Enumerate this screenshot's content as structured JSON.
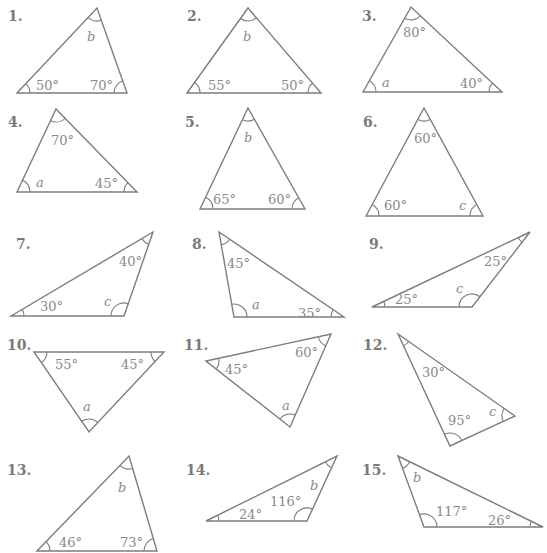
{
  "worksheet": {
    "topic": "Find the missing angle in each triangle",
    "line_color": "#7d7d7d",
    "text_color": "#8a8a8a",
    "problems": [
      {
        "number": "1.",
        "num_pos": [
          8,
          8
        ],
        "vertices": [
          [
            17,
            93
          ],
          [
            97,
            8
          ],
          [
            127,
            93
          ]
        ],
        "angles": [
          {
            "label": "50°",
            "var": false,
            "at": [
              36,
              79
            ]
          },
          {
            "label": "b",
            "var": true,
            "at": [
              87,
              30
            ]
          },
          {
            "label": "70°",
            "var": false,
            "at": [
              90,
              79
            ]
          }
        ]
      },
      {
        "number": "2.",
        "num_pos": [
          187,
          8
        ],
        "vertices": [
          [
            187,
            93
          ],
          [
            248,
            8
          ],
          [
            321,
            93
          ]
        ],
        "angles": [
          {
            "label": "55°",
            "var": false,
            "at": [
              208,
              79
            ]
          },
          {
            "label": "b",
            "var": true,
            "at": [
              243,
              30
            ]
          },
          {
            "label": "50°",
            "var": false,
            "at": [
              281,
              79
            ]
          }
        ]
      },
      {
        "number": "3.",
        "num_pos": [
          362,
          8
        ],
        "vertices": [
          [
            363,
            92
          ],
          [
            411,
            7
          ],
          [
            502,
            92
          ]
        ],
        "angles": [
          {
            "label": "a",
            "var": true,
            "at": [
              382,
              76
            ]
          },
          {
            "label": "80°",
            "var": false,
            "at": [
              403,
              26
            ]
          },
          {
            "label": "40°",
            "var": false,
            "at": [
              460,
              77
            ]
          }
        ]
      },
      {
        "number": "4.",
        "num_pos": [
          8,
          114
        ],
        "vertices": [
          [
            17,
            192
          ],
          [
            56,
            109
          ],
          [
            137,
            192
          ]
        ],
        "angles": [
          {
            "label": "a",
            "var": true,
            "at": [
              36,
              176
            ]
          },
          {
            "label": "70°",
            "var": false,
            "at": [
              51,
              134
            ]
          },
          {
            "label": "45°",
            "var": false,
            "at": [
              95,
              177
            ]
          }
        ]
      },
      {
        "number": "5.",
        "num_pos": [
          185,
          114
        ],
        "vertices": [
          [
            200,
            209
          ],
          [
            248,
            108
          ],
          [
            305,
            209
          ]
        ],
        "angles": [
          {
            "label": "65°",
            "var": false,
            "at": [
              213,
              193
            ]
          },
          {
            "label": "b",
            "var": true,
            "at": [
              244,
              131
            ]
          },
          {
            "label": "60°",
            "var": false,
            "at": [
              268,
              193
            ]
          }
        ]
      },
      {
        "number": "6.",
        "num_pos": [
          363,
          114
        ],
        "vertices": [
          [
            366,
            216
          ],
          [
            424,
            108
          ],
          [
            483,
            216
          ]
        ],
        "angles": [
          {
            "label": "60°",
            "var": false,
            "at": [
              384,
              199
            ]
          },
          {
            "label": "60°",
            "var": false,
            "at": [
              414,
              132
            ]
          },
          {
            "label": "c",
            "var": true,
            "at": [
              459,
              199
            ]
          }
        ]
      },
      {
        "number": "7.",
        "num_pos": [
          16,
          236
        ],
        "vertices": [
          [
            11,
            316
          ],
          [
            153,
            232
          ],
          [
            124,
            316
          ]
        ],
        "angles": [
          {
            "label": "30°",
            "var": false,
            "at": [
              40,
              300
            ]
          },
          {
            "label": "40°",
            "var": false,
            "at": [
              119,
              255
            ]
          },
          {
            "label": "c",
            "var": true,
            "at": [
              104,
              295
            ]
          }
        ]
      },
      {
        "number": "8.",
        "num_pos": [
          192,
          236
        ],
        "vertices": [
          [
            219,
            232
          ],
          [
            234,
            317
          ],
          [
            344,
            317
          ]
        ],
        "angles": [
          {
            "label": "45°",
            "var": false,
            "at": [
              227,
              257
            ]
          },
          {
            "label": "a",
            "var": true,
            "at": [
              252,
              298
            ]
          },
          {
            "label": "35°",
            "var": false,
            "at": [
              298,
              307
            ]
          }
        ]
      },
      {
        "number": "9.",
        "num_pos": [
          369,
          236
        ],
        "vertices": [
          [
            372,
            307
          ],
          [
            530,
            232
          ],
          [
            472,
            307
          ]
        ],
        "angles": [
          {
            "label": "25°",
            "var": false,
            "at": [
              395,
              293
            ]
          },
          {
            "label": "25°",
            "var": false,
            "at": [
              484,
              255
            ]
          },
          {
            "label": "c",
            "var": true,
            "at": [
              456,
              282
            ]
          }
        ]
      },
      {
        "number": "10.",
        "num_pos": [
          7,
          337
        ],
        "vertices": [
          [
            34,
            352
          ],
          [
            164,
            352
          ],
          [
            89,
            432
          ]
        ],
        "angles": [
          {
            "label": "55°",
            "var": false,
            "at": [
              55,
              358
            ]
          },
          {
            "label": "45°",
            "var": false,
            "at": [
              121,
              358
            ]
          },
          {
            "label": "a",
            "var": true,
            "at": [
              83,
              400
            ]
          }
        ]
      },
      {
        "number": "11.",
        "num_pos": [
          184,
          337
        ],
        "vertices": [
          [
            206,
            361
          ],
          [
            331,
            334
          ],
          [
            290,
            427
          ]
        ],
        "angles": [
          {
            "label": "45°",
            "var": false,
            "at": [
              225,
              363
            ]
          },
          {
            "label": "60°",
            "var": false,
            "at": [
              295,
              346
            ]
          },
          {
            "label": "a",
            "var": true,
            "at": [
              282,
              399
            ]
          }
        ]
      },
      {
        "number": "12.",
        "num_pos": [
          363,
          337
        ],
        "vertices": [
          [
            398,
            334
          ],
          [
            450,
            446
          ],
          [
            515,
            416
          ]
        ],
        "angles": [
          {
            "label": "30°",
            "var": false,
            "at": [
              422,
              366
            ]
          },
          {
            "label": "95°",
            "var": false,
            "at": [
              448,
              414
            ]
          },
          {
            "label": "c",
            "var": true,
            "at": [
              489,
              405
            ]
          }
        ]
      },
      {
        "number": "13.",
        "num_pos": [
          7,
          462
        ],
        "vertices": [
          [
            37,
            551
          ],
          [
            129,
            456
          ],
          [
            157,
            551
          ]
        ],
        "angles": [
          {
            "label": "46°",
            "var": false,
            "at": [
              59,
              536
            ]
          },
          {
            "label": "b",
            "var": true,
            "at": [
              118,
              481
            ]
          },
          {
            "label": "73°",
            "var": false,
            "at": [
              120,
              536
            ]
          }
        ]
      },
      {
        "number": "14.",
        "num_pos": [
          186,
          462
        ],
        "vertices": [
          [
            206,
            521
          ],
          [
            337,
            456
          ],
          [
            307,
            521
          ]
        ],
        "angles": [
          {
            "label": "24°",
            "var": false,
            "at": [
              239,
              508
            ]
          },
          {
            "label": "116°",
            "var": false,
            "at": [
              270,
              495
            ]
          },
          {
            "label": "b",
            "var": true,
            "at": [
              310,
              479
            ]
          }
        ]
      },
      {
        "number": "15.",
        "num_pos": [
          362,
          462
        ],
        "vertices": [
          [
            398,
            456
          ],
          [
            424,
            527
          ],
          [
            543,
            527
          ]
        ],
        "angles": [
          {
            "label": "b",
            "var": true,
            "at": [
              413,
              471
            ]
          },
          {
            "label": "117°",
            "var": false,
            "at": [
              436,
              505
            ]
          },
          {
            "label": "26°",
            "var": false,
            "at": [
              488,
              514
            ]
          }
        ]
      }
    ]
  }
}
